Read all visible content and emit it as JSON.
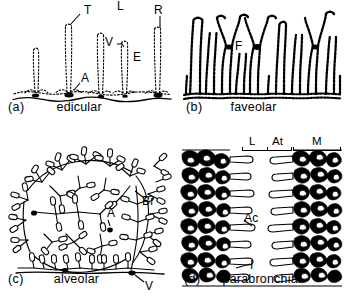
{
  "figure": {
    "background_color": "#ffffff",
    "ink_color": "#000000",
    "panels": [
      {
        "letter": "(a)",
        "name": "edicular",
        "annotations": [
          {
            "text": "T"
          },
          {
            "text": "L"
          },
          {
            "text": "R"
          },
          {
            "text": "V"
          },
          {
            "text": "E"
          },
          {
            "text": "A"
          }
        ]
      },
      {
        "letter": "(b)",
        "name": "faveolar",
        "annotations": [
          {
            "text": "F"
          }
        ]
      },
      {
        "letter": "(c)",
        "name": "alveolar",
        "annotations": [
          {
            "text": "Br"
          },
          {
            "text": "A"
          },
          {
            "text": "V"
          }
        ]
      },
      {
        "letter": "(d)",
        "name": "parabronchial",
        "annotations": [
          {
            "text": "Ac"
          },
          {
            "text": "I"
          }
        ],
        "zone_labels": [
          {
            "text": "L"
          },
          {
            "text": "At"
          },
          {
            "text": "M"
          }
        ]
      }
    ]
  },
  "panel_a": {
    "letter": "(a)",
    "name": "edicular",
    "label_T": "T",
    "label_L": "L",
    "label_R": "R",
    "label_V": "V",
    "label_E": "E",
    "label_A": "A"
  },
  "panel_b": {
    "letter": "(b)",
    "name": "faveolar",
    "label_F": "F"
  },
  "panel_c": {
    "letter": "(c)",
    "name": "alveolar",
    "label_Br": "Br",
    "label_A": "A",
    "label_V": "V"
  },
  "panel_d": {
    "letter": "(d)",
    "name": "parabronchial",
    "label_Ac": "Ac",
    "label_I": "I",
    "zone_L": "L",
    "zone_At": "At",
    "zone_M": "M"
  }
}
